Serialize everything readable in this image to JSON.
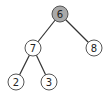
{
  "tree": {
    "nodes": [
      {
        "id": "n6",
        "label": "6",
        "x": 60,
        "y": 14,
        "fill": "#a9a9a9",
        "highlighted": true
      },
      {
        "id": "n7",
        "label": "7",
        "x": 33,
        "y": 48,
        "fill": "#ffffff",
        "highlighted": false
      },
      {
        "id": "n8",
        "label": "8",
        "x": 94,
        "y": 48,
        "fill": "#ffffff",
        "highlighted": false
      },
      {
        "id": "n2",
        "label": "2",
        "x": 16,
        "y": 82,
        "fill": "#ffffff",
        "highlighted": false
      },
      {
        "id": "n3",
        "label": "3",
        "x": 49,
        "y": 82,
        "fill": "#ffffff",
        "highlighted": false
      }
    ],
    "edges": [
      {
        "from": "n6",
        "to": "n7"
      },
      {
        "from": "n6",
        "to": "n8"
      },
      {
        "from": "n7",
        "to": "n2"
      },
      {
        "from": "n7",
        "to": "n3"
      }
    ],
    "node_radius": 8,
    "colors": {
      "highlight": "#a9a9a9",
      "default": "#ffffff",
      "edge": "#333333"
    }
  }
}
